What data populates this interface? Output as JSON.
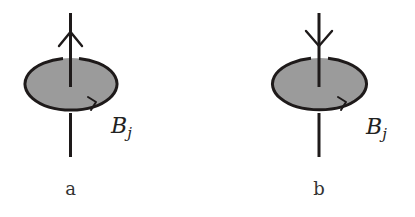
{
  "diagram": {
    "colors": {
      "stroke": "#1e1a1a",
      "disk_fill": "#9b9b9b",
      "text": "#222222"
    },
    "panels": [
      {
        "id": "a",
        "caption": "a",
        "label_base": "B",
        "label_sub": "j",
        "arrow_direction": "up"
      },
      {
        "id": "b",
        "caption": "b",
        "label_base": "B",
        "label_sub": "j",
        "arrow_direction": "down"
      }
    ]
  }
}
